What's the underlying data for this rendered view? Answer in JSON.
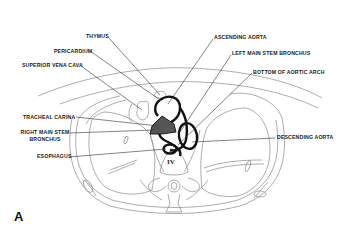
{
  "figure": {
    "panel_label": "A",
    "vertebra_label": "IV",
    "labels": {
      "thymus": "THYMUS",
      "pericardium": "PERICARDIUM",
      "superior_vena_cava": "SUPERIOR VENA CAVA",
      "ascending_aorta": "ASCENDING AORTA",
      "left_main_stem_bronchus": "LEFT MAIN STEM BRONCHUS",
      "bottom_of_aortic_arch": "BOTTOM OF AORTIC ARCH",
      "tracheal_carina": "TRACHEAL CARINA",
      "right_main_stem_bronchus_line1": "RIGHT MAIN STEM",
      "right_main_stem_bronchus_line2": "BRONCHUS",
      "esophagus": "ESOPHAGUS",
      "descending_aorta": "DESCENDING AORTA"
    },
    "colors": {
      "outline": "#8a8a8a",
      "vessel": "#111111",
      "leader": "#333333",
      "carina_fill": "#555555"
    }
  }
}
